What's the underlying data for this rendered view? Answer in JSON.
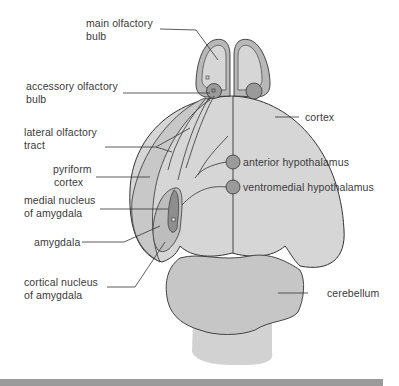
{
  "figure": {
    "colors": {
      "cortex_fill": "#d6d6d6",
      "bulb_rim": "#b8b8b8",
      "nucleus_fill": "#9a9a9a",
      "amygdala_fill": "#bdbdbd",
      "medial_nucleus_fill": "#8e8e8e",
      "cerebellum_fill": "#c6c6c6",
      "brainstem_fill": "#d2d2d2",
      "outline": "#333333",
      "bar": "#9a9a9a"
    }
  },
  "labels": {
    "main_olfactory_bulb": [
      "main olfactory",
      "bulb"
    ],
    "accessory_olfactory_bulb": [
      "accessory olfactory",
      "bulb"
    ],
    "lateral_olfactory_tract": [
      "lateral olfactory",
      "tract"
    ],
    "pyriform_cortex": [
      "pyriform",
      "cortex"
    ],
    "medial_nucleus_of_amygdala": [
      "medial nucleus",
      "of amygdala"
    ],
    "amygdala": [
      "amygdala"
    ],
    "cortical_nucleus_of_amygdala": [
      "cortical nucleus",
      "of amygdala"
    ],
    "cortex": [
      "cortex"
    ],
    "anterior_hypothalamus": [
      "anterior hypothalamus"
    ],
    "ventromedial_hypothalamus": [
      "ventromedial hypothalamus"
    ],
    "cerebellum": [
      "cerebellum"
    ]
  }
}
